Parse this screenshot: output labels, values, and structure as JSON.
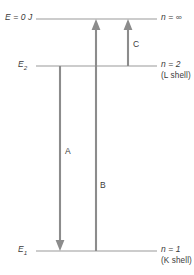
{
  "diagram": {
    "colors": {
      "line": "#9a9a9a",
      "arrow": "#8c8c8c",
      "text": "#3b3b3b",
      "background": "#ffffff"
    },
    "levels": [
      {
        "id": "n-infinity",
        "left_label": "E = 0 J",
        "right_label": "n = ∞",
        "shell_label": "",
        "y": 19
      },
      {
        "id": "n-2",
        "left_label": "E",
        "left_label_sub": "2",
        "right_label": "n = 2",
        "shell_label": "(L shell)",
        "y": 66
      },
      {
        "id": "n-1",
        "left_label": "E",
        "left_label_sub": "1",
        "right_label": "n = 1",
        "shell_label": "(K shell)",
        "y": 251
      }
    ],
    "transitions": [
      {
        "id": "transition-a",
        "label": "A",
        "from_level": "n-2",
        "to_level": "n-1",
        "direction": "down",
        "x": 60
      },
      {
        "id": "transition-b",
        "label": "B",
        "from_level": "n-1",
        "to_level": "n-infinity",
        "direction": "up",
        "x": 96
      },
      {
        "id": "transition-c",
        "label": "C",
        "from_level": "n-2",
        "to_level": "n-infinity",
        "direction": "up",
        "x": 128
      }
    ]
  }
}
